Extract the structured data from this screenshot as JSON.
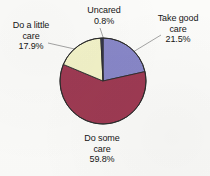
{
  "chart_data": {
    "type": "pie",
    "title": "",
    "subtitle": "",
    "xlabel": "",
    "ylabel": "",
    "legend_position": "none",
    "grid": false,
    "labels_outside": true,
    "start_angle_deg": 0,
    "direction": "clockwise",
    "categories": [
      "Take good care",
      "Do some care",
      "Do a little care",
      "Uncared"
    ],
    "values": [
      21.5,
      59.8,
      17.9,
      0.8
    ],
    "value_suffix": "%",
    "slices": [
      {
        "name": "take-good-care",
        "label": "Take good care",
        "label_line1": "Take good",
        "label_line2": "care",
        "value": 21.5,
        "value_text": "21.5%",
        "color": "#8887c8",
        "start_deg": 0,
        "end_deg": 77.4
      },
      {
        "name": "do-some-care",
        "label": "Do some care",
        "label_line1": "Do some",
        "label_line2": "care",
        "value": 59.8,
        "value_text": "59.8%",
        "color": "#9e3a53",
        "start_deg": 77.4,
        "end_deg": 292.68
      },
      {
        "name": "do-a-little-care",
        "label": "Do a little care",
        "label_line1": "Do a little",
        "label_line2": "care",
        "value": 17.9,
        "value_text": "17.9%",
        "color": "#f2f2c8",
        "start_deg": 292.68,
        "end_deg": 357.12
      },
      {
        "name": "uncared",
        "label": "Uncared",
        "label_line1": "Uncared",
        "label_line2": "",
        "value": 0.8,
        "value_text": "0.8%",
        "color": "#3b3f63",
        "start_deg": 357.12,
        "end_deg": 360
      }
    ],
    "geometry": {
      "center_x": 103,
      "center_y": 81,
      "radius": 43
    },
    "style": {
      "background": "#fbfbf9",
      "outline_color": "#2b2b2b",
      "leader_color": "#8d8d8d",
      "text_color": "#151515"
    }
  }
}
